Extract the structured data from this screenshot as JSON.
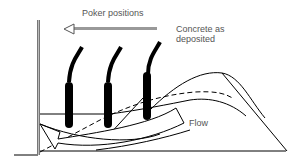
{
  "labels": {
    "poker_positions": "Poker positions",
    "concrete_line1": "Concrete as",
    "concrete_line2": "deposited",
    "flow": "Flow"
  },
  "elements": {
    "formwork": "vertical-formwork-wall",
    "pokers": [
      "poker-1",
      "poker-2",
      "poker-3"
    ],
    "direction_arrow": "left-arrow",
    "profiles": [
      "deposited-profile-solid",
      "intermediate-profile-dashed",
      "lower-profile-solid"
    ],
    "flow_arrow": "curved-flow-arrow"
  },
  "colors": {
    "ink": "#000000",
    "text": "#555555",
    "arrow_gray": "#888888"
  }
}
